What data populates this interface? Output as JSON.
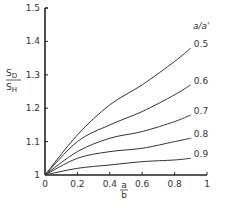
{
  "chart_data": {
    "type": "line",
    "title": "",
    "xlabel": "a/b",
    "ylabel": "S_D/S_H",
    "xlabel_parts": {
      "numerator": "a",
      "denominator": "b"
    },
    "ylabel_parts": {
      "numerator": "S",
      "numerator_sub": "D",
      "denominator": "S",
      "denominator_sub": "H"
    },
    "xlim": [
      0,
      1
    ],
    "ylim": [
      1,
      1.5
    ],
    "x_ticks": [
      "0",
      "0.2",
      "0.4",
      "0.6",
      "0.8",
      "1"
    ],
    "x_tick_values": [
      0,
      0.2,
      0.4,
      0.6,
      0.8,
      1.0
    ],
    "y_ticks": [
      "1",
      "1.1",
      "1.2",
      "1.3",
      "1.4",
      "1.5"
    ],
    "y_tick_values": [
      1.0,
      1.1,
      1.2,
      1.3,
      1.4,
      1.5
    ],
    "grid": false,
    "legend_title": "a/a'",
    "legend_position": "right, at curve ends",
    "x": [
      0,
      0.2,
      0.4,
      0.6,
      0.8,
      0.9
    ],
    "series": [
      {
        "name": "0.5",
        "values": [
          1.0,
          1.12,
          1.21,
          1.27,
          1.34,
          1.38
        ]
      },
      {
        "name": "0.6",
        "values": [
          1.0,
          1.1,
          1.15,
          1.19,
          1.24,
          1.27
        ]
      },
      {
        "name": "0.7",
        "values": [
          1.0,
          1.07,
          1.11,
          1.13,
          1.16,
          1.18
        ]
      },
      {
        "name": "0.8",
        "values": [
          1.0,
          1.05,
          1.07,
          1.08,
          1.1,
          1.11
        ]
      },
      {
        "name": "0.9",
        "values": [
          1.0,
          1.02,
          1.03,
          1.04,
          1.045,
          1.05
        ]
      }
    ]
  },
  "labels": {
    "legend_title": "a/a'",
    "y_num": "S",
    "y_num_sub": "D",
    "y_den": "S",
    "y_den_sub": "H",
    "x_num": "a",
    "x_den": "b"
  }
}
